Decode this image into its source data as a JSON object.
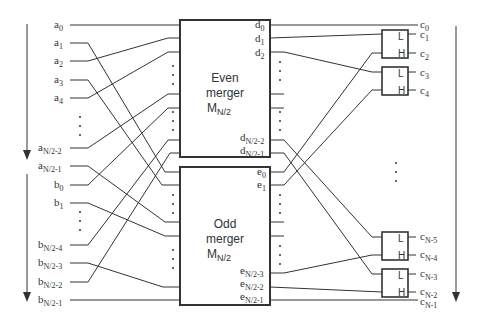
{
  "diagram": {
    "inputs_a": [
      {
        "base": "a",
        "sub": "0",
        "y": 25
      },
      {
        "base": "a",
        "sub": "1",
        "y": 43
      },
      {
        "base": "a",
        "sub": "2",
        "y": 61
      },
      {
        "base": "a",
        "sub": "3",
        "y": 80
      },
      {
        "base": "a",
        "sub": "4",
        "y": 98
      },
      {
        "base": "a",
        "sub": "N/2-2",
        "y": 148
      },
      {
        "base": "a",
        "sub": "N/2-1",
        "y": 166
      }
    ],
    "inputs_b": [
      {
        "base": "b",
        "sub": "0",
        "y": 185
      },
      {
        "base": "b",
        "sub": "1",
        "y": 203
      },
      {
        "base": "b",
        "sub": "N/2-4",
        "y": 245
      },
      {
        "base": "b",
        "sub": "N/2-3",
        "y": 263
      },
      {
        "base": "b",
        "sub": "N/2-2",
        "y": 282
      },
      {
        "base": "b",
        "sub": "N/2-1",
        "y": 300
      }
    ],
    "even_merger": {
      "line1": "Even",
      "line2": "merger",
      "line3": "M",
      "line3_sub": "N/2"
    },
    "odd_merger": {
      "line1": "Odd",
      "line2": "merger",
      "line3": "M",
      "line3_sub": "N/2"
    },
    "even_outputs": [
      {
        "base": "d",
        "sub": "0"
      },
      {
        "base": "d",
        "sub": "1"
      },
      {
        "base": "d",
        "sub": "2"
      },
      {
        "base": "d",
        "sub": "N/2-2"
      },
      {
        "base": "d",
        "sub": "N/2-1"
      }
    ],
    "odd_outputs": [
      {
        "base": "e",
        "sub": "0"
      },
      {
        "base": "e",
        "sub": "1"
      },
      {
        "base": "e",
        "sub": "N/2-3"
      },
      {
        "base": "e",
        "sub": "N/2-2"
      },
      {
        "base": "e",
        "sub": "N/2-1"
      }
    ],
    "comparator": {
      "low": "L",
      "high": "H"
    },
    "outputs_c": [
      {
        "base": "c",
        "sub": "0"
      },
      {
        "base": "c",
        "sub": "1"
      },
      {
        "base": "c",
        "sub": "2"
      },
      {
        "base": "c",
        "sub": "3"
      },
      {
        "base": "c",
        "sub": "4"
      },
      {
        "base": "c",
        "sub": "N-5"
      },
      {
        "base": "c",
        "sub": "N-4"
      },
      {
        "base": "c",
        "sub": "N-3"
      },
      {
        "base": "c",
        "sub": "N-2"
      },
      {
        "base": "c",
        "sub": "N-1"
      }
    ],
    "ellipsis": "⋮",
    "colors": {
      "line": "#333333",
      "background": "#ffffff"
    }
  }
}
